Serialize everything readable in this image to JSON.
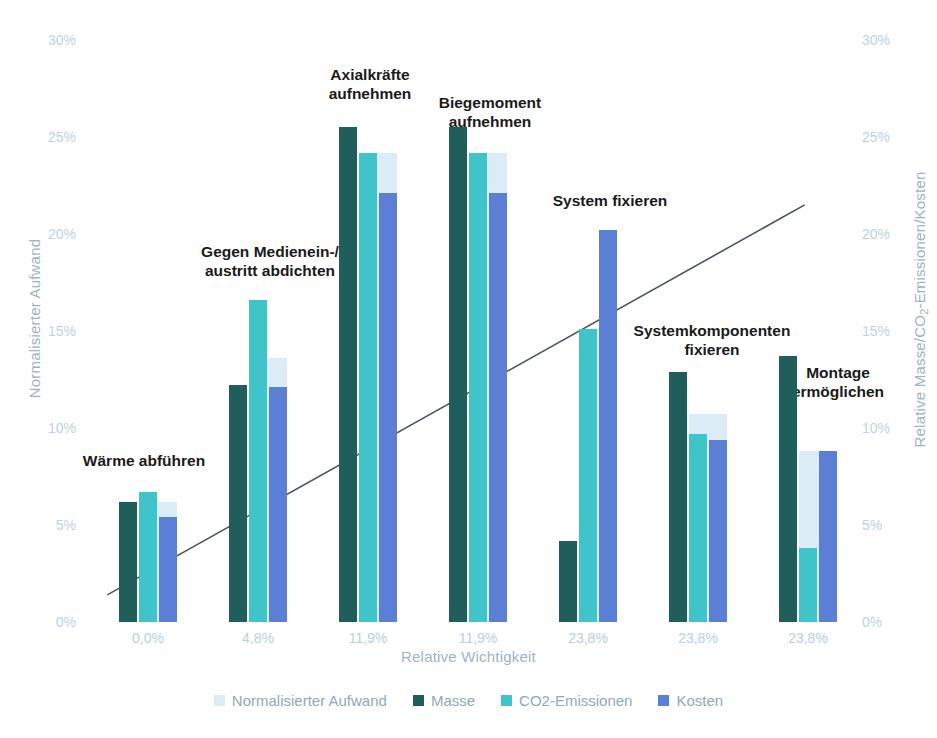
{
  "chart_data": {
    "type": "bar",
    "title": "",
    "xlabel": "Relative Wichtigkeit",
    "ylabel": "Normalisierter Aufwand",
    "ylabel_right": "Relative Masse/CO2-Emissionen/Kosten",
    "ylim": [
      0,
      30
    ],
    "yticks": [
      "0%",
      "5%",
      "10%",
      "15%",
      "20%",
      "25%",
      "30%"
    ],
    "ytick_values": [
      0,
      5,
      10,
      15,
      20,
      25,
      30
    ],
    "grid": false,
    "legend_position": "bottom",
    "categories": [
      "0,0%",
      "4,8%",
      "11,9%",
      "11,9%",
      "23,8%",
      "23,8%",
      "23,8%"
    ],
    "group_labels": [
      "Wärme abführen",
      "Gegen Medienein-/\naustritt abdichten",
      "Axialkräfte\naufnehmen",
      "Biegemoment\naufnehmen",
      "System fixieren",
      "Systemkomponenten\nfixieren",
      "Montage\nermöglichen"
    ],
    "series": [
      {
        "name": "Normalisierter Aufwand",
        "color": "#dcecf7",
        "values": [
          6.2,
          13.6,
          24.2,
          24.2,
          15.1,
          10.7,
          8.8
        ]
      },
      {
        "name": "Masse",
        "color": "#1f5e5b",
        "values": [
          6.2,
          12.2,
          25.5,
          25.5,
          4.2,
          12.9,
          13.7
        ]
      },
      {
        "name": "CO2-Emissionen",
        "color": "#3fc4c9",
        "values": [
          6.7,
          16.6,
          24.2,
          24.2,
          15.1,
          9.7,
          3.8
        ]
      },
      {
        "name": "Kosten",
        "color": "#5a7fd4",
        "values": [
          5.4,
          12.1,
          22.1,
          22.1,
          20.2,
          9.4,
          8.8
        ]
      }
    ],
    "trend_line": {
      "name": "trend",
      "color": "#4a5560",
      "start": {
        "x": 0.13,
        "y": 1.4
      },
      "end": {
        "x": 6.47,
        "y": 21.5
      }
    }
  },
  "axes": {
    "left_title": "Normalisierter Aufwand",
    "right_title_prefix": "Relative Masse/CO",
    "right_title_sub": "2",
    "right_title_suffix": "-Emissionen/Kosten",
    "x_title": "Relative Wichtigkeit"
  },
  "legend": {
    "items": [
      {
        "label": "Normalisierter Aufwand",
        "color": "#dcecf7"
      },
      {
        "label": "Masse",
        "color": "#1f5e5b"
      },
      {
        "label": "CO2-Emissionen",
        "color": "#3fc4c9"
      },
      {
        "label": "Kosten",
        "color": "#5a7fd4"
      }
    ]
  }
}
